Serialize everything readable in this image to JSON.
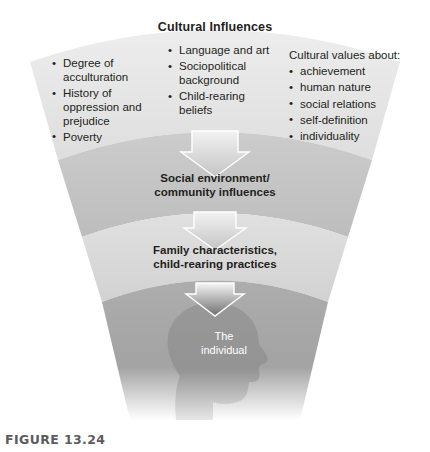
{
  "figure": {
    "caption": "FIGURE 13.24",
    "title": "Cultural Influences"
  },
  "columns": {
    "left": {
      "items": [
        "Degree of acculturation",
        "History of oppression and prejudice",
        "Poverty"
      ]
    },
    "middle": {
      "items": [
        "Language and art",
        "Sociopolitical background",
        "Child-rearing beliefs"
      ]
    },
    "right": {
      "heading": "Cultural values about:",
      "items": [
        "achievement",
        "human nature",
        "social relations",
        "self-definition",
        "individuality"
      ]
    }
  },
  "bands": {
    "social": {
      "line1": "Social environment/",
      "line2": "community influences"
    },
    "family": {
      "line1": "Family characteristics,",
      "line2": "child-rearing practices"
    },
    "individual": {
      "line1": "The",
      "line2": "individual"
    }
  },
  "colors": {
    "band_1": "#e3e3e3",
    "band_2": "#c9c9c9",
    "band_3": "#dcdcdc",
    "band_4": "#a8a8a8",
    "silhouette": "#8f8f8f",
    "arrow": "#d2d2d2",
    "text": "#231f20",
    "caption": "#5c5c5c",
    "individual_text": "#ffffff"
  }
}
